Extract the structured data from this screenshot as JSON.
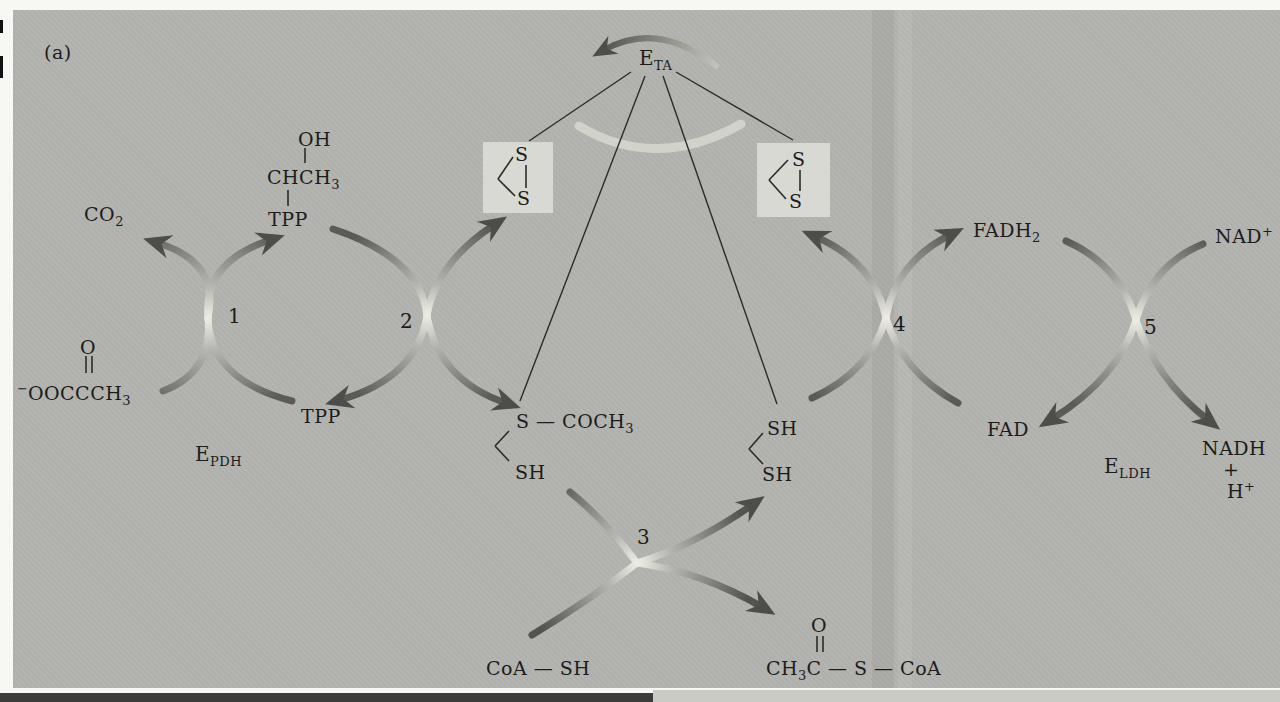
{
  "panel_label": "(a)",
  "colors": {
    "page_bg": "#f7f7f3",
    "panel_bg": "#b3b3af",
    "lipoamide_box_bg": "#d9d9d3",
    "arrow_dark": "#5a5a56",
    "arrow_crossing_light": "#eeeee7",
    "arrowhead": "#4d4d49",
    "bond_line": "#2b2b28",
    "rotation_arc_light": "#d6d6cf",
    "bottom_bar": "#3c3c3a"
  },
  "enzymes": {
    "transacetylase": {
      "base": "E",
      "sub": "TA"
    },
    "pyruvate_dehydrogenase": {
      "base": "E",
      "sub": "PDH"
    },
    "lipoamide_dehydrogenase": {
      "base": "E",
      "sub": "LDH"
    }
  },
  "steps": {
    "s1": "1",
    "s2": "2",
    "s3": "3",
    "s4": "4",
    "s5": "5"
  },
  "molecules": {
    "co2": {
      "base": "CO",
      "sub": "2"
    },
    "hydroxyethyl_tpp": {
      "oh": "OH",
      "ch": "CHCH",
      "ch_sub": "3",
      "tpp": "TPP"
    },
    "pyruvate": {
      "o": "O",
      "charge": "−",
      "base": "OOCCCH",
      "sub": "3"
    },
    "tpp_free": "TPP",
    "lipoamide_s": "S",
    "acetyl_dihydrolipoamide": {
      "s_group": "S — COCH",
      "s_group_sub": "3",
      "sh": "SH"
    },
    "dihydrolipoamide": {
      "sh_top": "SH",
      "sh_bottom": "SH"
    },
    "coa_sh": "CoA — SH",
    "acetyl_coa": {
      "o": "O",
      "ch": "CH",
      "ch_sub": "3",
      "rest": "C — S — CoA"
    },
    "fadh2": {
      "base": "FADH",
      "sub": "2"
    },
    "fad": "FAD",
    "nad": {
      "base": "NAD",
      "sup": "+"
    },
    "nadh": {
      "base": "NADH",
      "plus": "+",
      "h": "H",
      "h_sup": "+"
    }
  }
}
